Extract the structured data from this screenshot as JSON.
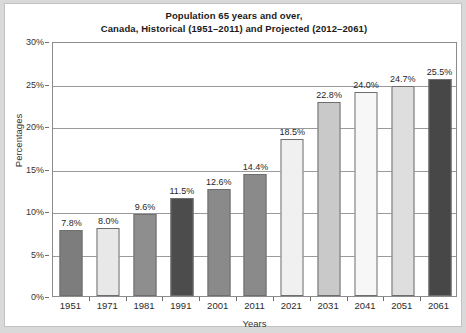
{
  "chart_data": {
    "type": "bar",
    "title": "Population 65 years and over,\nCanada, Historical (1951–2011) and Projected (2012–2061)",
    "title_line1": "Population 65 years and over,",
    "title_line2": "Canada, Historical (1951–2011) and Projected (2012–2061)",
    "xlabel": "Years",
    "ylabel": "Percentages",
    "categories": [
      "1951",
      "1971",
      "1981",
      "1991",
      "2001",
      "2011",
      "2021",
      "2031",
      "2041",
      "2051",
      "2061"
    ],
    "values": [
      7.8,
      8.0,
      9.6,
      11.5,
      12.6,
      14.4,
      18.5,
      22.8,
      24.0,
      24.7,
      25.5
    ],
    "value_labels": [
      "7.8%",
      "8.0%",
      "9.6%",
      "11.5%",
      "12.6%",
      "14.4%",
      "18.5%",
      "22.8%",
      "24.0%",
      "24.7%",
      "25.5%"
    ],
    "bar_colors": [
      "#7d7d7d",
      "#e8e8e8",
      "#8e8e8e",
      "#4c4c4c",
      "#8a8a8a",
      "#8a8a8a",
      "#f0f0f0",
      "#c9c9c9",
      "#f7f7f7",
      "#dedede",
      "#474747"
    ],
    "ylim": [
      0,
      30
    ],
    "ytick_labels": [
      "0%",
      "5%",
      "10%",
      "15%",
      "20%",
      "25%",
      "30%"
    ],
    "ytick_values": [
      0,
      5,
      10,
      15,
      20,
      25,
      30
    ],
    "grid": true,
    "grid_axis": "y",
    "legend": "none",
    "background_color": "#ffffff",
    "page_background_color": "#d9d9d9",
    "axis_color": "#8c8c8c"
  }
}
